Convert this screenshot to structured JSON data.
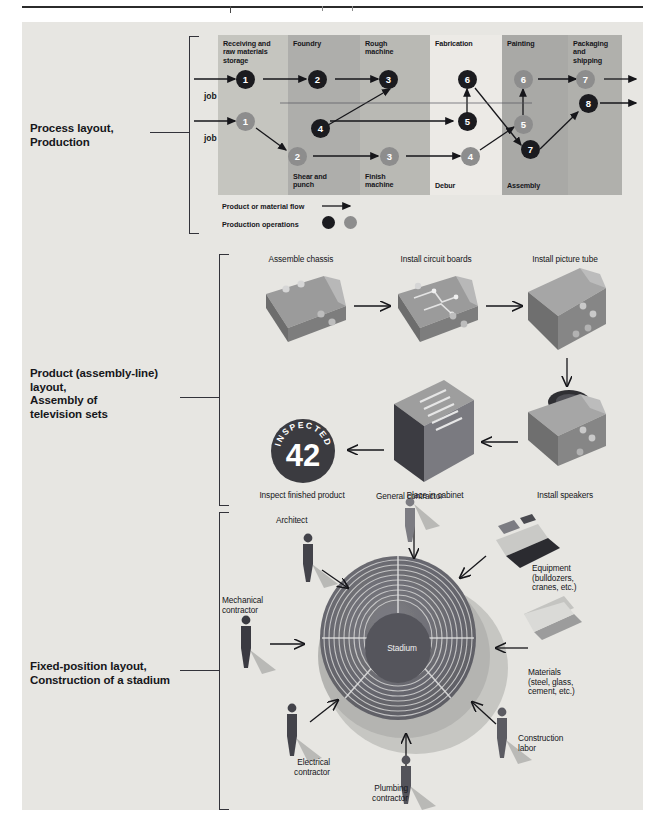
{
  "page": {
    "background": "#e7e6e2",
    "accent_dark": "#1b1b1f",
    "accent_light": "#8d8d8d"
  },
  "sections": [
    {
      "id": "process-layout",
      "label_lines": [
        "Process layout,",
        "Production"
      ],
      "departments": [
        {
          "name": "Receiving and\nraw materials\nstorage",
          "label_top": "Receiving and",
          "label_top2": "raw materials",
          "label_top3": "storage",
          "shade": "#c3c3bd"
        },
        {
          "name": "Foundry",
          "shade": "#adadad"
        },
        {
          "name": "Rough\nmachine",
          "shade": "#b6b6b2"
        },
        {
          "name": "Fabrication",
          "shade": "#ebebe7"
        },
        {
          "name": "Painting",
          "shade": "#a8a8a6"
        },
        {
          "name": "Packaging\nand\nshipping",
          "shade": "#b0b0ad"
        }
      ],
      "top_labels": [
        "Receiving and raw materials storage",
        "Foundry",
        "Rough machine",
        "Fabrication",
        "Painting",
        "Packaging and shipping"
      ],
      "bottom_labels": [
        "Shear and punch",
        "Finish machine",
        "Debur",
        "Assembly"
      ],
      "jobs": [
        {
          "name": "job X",
          "color": "dark",
          "operations": [
            "1",
            "2",
            "3",
            "4",
            "5",
            "6",
            "7",
            "8"
          ]
        },
        {
          "name": "job Y",
          "color": "light",
          "operations": [
            "1",
            "2",
            "3",
            "4",
            "5",
            "6",
            "7"
          ]
        }
      ],
      "job_x_label": "job X",
      "job_y_label": "job Y",
      "legend": {
        "flow_label": "Product or material flow",
        "operations_label": "Production operations"
      }
    },
    {
      "id": "product-layout",
      "label_lines": [
        "Product (assembly-line)",
        "layout,",
        "Assembly of",
        "television sets"
      ],
      "steps": [
        {
          "label": "Assemble chassis"
        },
        {
          "label": "Install circuit boards"
        },
        {
          "label": "Install picture tube"
        },
        {
          "label": "Install speakers"
        },
        {
          "label": "Place in cabinet"
        },
        {
          "label": "Inspect finished product"
        }
      ],
      "badge": {
        "ring_text": "INSPECTED BY",
        "number": "42"
      }
    },
    {
      "id": "fixed-position-layout",
      "label_lines": [
        "Fixed-position layout,",
        "Construction of a stadium"
      ],
      "center_label": "Stadium",
      "resources": [
        {
          "label": "General contractor",
          "kind": "person"
        },
        {
          "label": "Architect",
          "kind": "person"
        },
        {
          "label": "Mechanical\ncontractor",
          "line1": "Mechanical",
          "line2": "contractor",
          "kind": "person"
        },
        {
          "label": "Electrical\ncontractor",
          "line1": "Electrical",
          "line2": "contractor",
          "kind": "person"
        },
        {
          "label": "Plumbing\ncontractor",
          "line1": "Plumbing",
          "line2": "contractor",
          "kind": "person"
        },
        {
          "label": "Construction\nlabor",
          "line1": "Construction",
          "line2": "labor",
          "kind": "person"
        },
        {
          "label": "Equipment (bulldozers, cranes, etc.)",
          "line1": "Equipment",
          "line2": "(bulldozers,",
          "line3": "cranes, etc.)",
          "kind": "object"
        },
        {
          "label": "Materials (steel, glass, cement, etc.)",
          "line1": "Materials",
          "line2": "(steel, glass,",
          "line3": "cement, etc.)",
          "kind": "object"
        }
      ]
    }
  ]
}
